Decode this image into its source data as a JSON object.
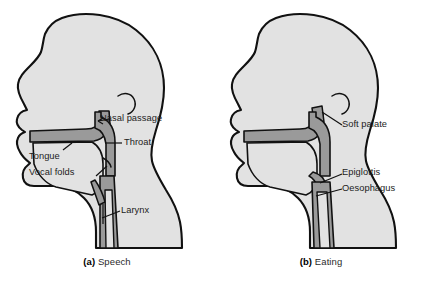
{
  "figure": {
    "type": "anatomical-diagram",
    "colors": {
      "head_fill": "#e2e2e2",
      "tract_fill": "#9a9a9a",
      "outline": "#111111",
      "label_text": "#1c1c1c",
      "background": "#ffffff"
    }
  },
  "panels": [
    {
      "id": "speech",
      "caption_marker": "(a)",
      "caption_text": "Speech",
      "labels": [
        {
          "id": "nasal-passage",
          "text": "Nasal passage"
        },
        {
          "id": "throat",
          "text": "Throat"
        },
        {
          "id": "tongue",
          "text": "Tongue"
        },
        {
          "id": "vocal-folds",
          "text": "Vocal folds"
        },
        {
          "id": "larynx",
          "text": "Larynx"
        }
      ]
    },
    {
      "id": "eating",
      "caption_marker": "(b)",
      "caption_text": "Eating",
      "labels": [
        {
          "id": "soft-palate",
          "text": "Soft palate"
        },
        {
          "id": "epiglottis",
          "text": "Epiglottis"
        },
        {
          "id": "oesophagus",
          "text": "Oesophagus"
        }
      ]
    }
  ]
}
